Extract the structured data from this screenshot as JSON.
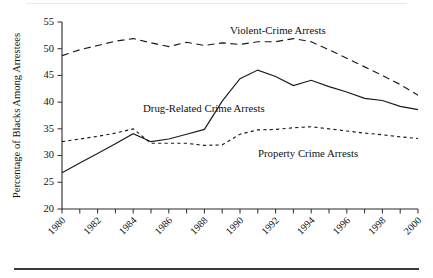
{
  "chart_data": {
    "type": "line",
    "title": "",
    "xlabel": "",
    "ylabel": "Percentage of Blacks Among Arrestees",
    "ylim": [
      20,
      55
    ],
    "xlim": [
      1980,
      2000
    ],
    "yticks": [
      20,
      25,
      30,
      35,
      40,
      45,
      50,
      55
    ],
    "xticks": [
      1980,
      1982,
      1984,
      1986,
      1988,
      1990,
      1992,
      1994,
      1996,
      1998,
      2000
    ],
    "xtick_labels": [
      "1980",
      "1982",
      "1984",
      "1986",
      "1988",
      "1990",
      "1992",
      "1994",
      "1996",
      "1998",
      "2000"
    ],
    "ytick_labels": [
      "20",
      "25",
      "30",
      "35",
      "40",
      "45",
      "50",
      "55"
    ],
    "grid": false,
    "legend_position": "inline-annotations",
    "x": [
      1980,
      1981,
      1982,
      1983,
      1984,
      1985,
      1986,
      1987,
      1988,
      1989,
      1990,
      1991,
      1992,
      1993,
      1994,
      1995,
      1996,
      1997,
      1998,
      1999,
      2000
    ],
    "series": [
      {
        "name": "Violent-Crime Arrests",
        "style": "long-dashed",
        "color": "#1a1a1a",
        "values": [
          48.7,
          49.8,
          50.6,
          51.4,
          51.9,
          51.1,
          50.4,
          51.2,
          50.6,
          51.1,
          50.8,
          51.3,
          51.3,
          51.9,
          51.3,
          49.8,
          48.2,
          46.6,
          45.0,
          43.3,
          41.3
        ]
      },
      {
        "name": "Drug-Related Crime Arrests",
        "style": "solid",
        "color": "#1a1a1a",
        "values": [
          26.8,
          28.6,
          30.4,
          32.2,
          34.1,
          32.6,
          33.1,
          34.0,
          34.9,
          40.2,
          44.4,
          46.0,
          44.8,
          43.1,
          44.1,
          42.9,
          41.9,
          40.7,
          40.3,
          39.2,
          38.6
        ]
      },
      {
        "name": "Property Crime Arrests",
        "style": "short-dashed",
        "color": "#1a1a1a",
        "values": [
          32.6,
          33.1,
          33.6,
          34.2,
          35.0,
          32.3,
          32.3,
          32.3,
          31.9,
          32.0,
          34.0,
          34.8,
          34.9,
          35.2,
          35.4,
          35.0,
          34.6,
          34.2,
          33.9,
          33.5,
          33.2
        ]
      }
    ],
    "annotations": [
      {
        "text": "Violent-Crime Arrests",
        "x_px": 230,
        "y_px": 34
      },
      {
        "text": "Drug-Related Crime Arrests",
        "x_px": 143,
        "y_px": 112
      },
      {
        "text": "Property Crime Arrests",
        "x_px": 258,
        "y_px": 157
      }
    ]
  }
}
